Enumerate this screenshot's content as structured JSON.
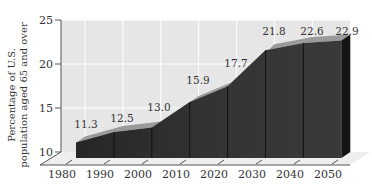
{
  "chart_data": {
    "type": "area",
    "title": "",
    "xlabel": "",
    "ylabel": "Percentage of U.S. population aged 65 and over",
    "ylabel_lines": [
      "Percentage of U.S.",
      "population aged 65 and over"
    ],
    "x": [
      1980,
      1990,
      2000,
      2010,
      2020,
      2030,
      2040,
      2050
    ],
    "values": [
      11.3,
      12.5,
      13.0,
      15.9,
      17.7,
      21.8,
      22.6,
      22.9
    ],
    "data_labels": [
      "11.3",
      "12.5",
      "13.0",
      "15.9",
      "17.7",
      "21.8",
      "22.6",
      "22.9"
    ],
    "x_tick_labels": [
      "1980",
      "1990",
      "2000",
      "2010",
      "2020",
      "2030",
      "2040",
      "2050"
    ],
    "y_ticks": [
      10,
      15,
      20,
      25
    ],
    "y_tick_labels": [
      "10",
      "15",
      "20",
      "25"
    ],
    "ylim": [
      10,
      25
    ],
    "grid": true,
    "style": "3d",
    "colors": {
      "area_front": "#2b2b2b",
      "area_top": "#9a9a9a",
      "area_side": "#151515",
      "wall": "#e6e6e6",
      "floor": "#eeeeee",
      "grid": "#ffffff",
      "axis": "#555555"
    }
  }
}
